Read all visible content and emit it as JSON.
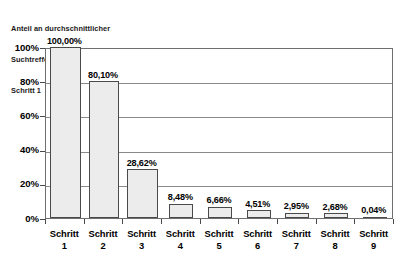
{
  "chart_data": {
    "type": "bar",
    "title": "Anteil an durchschnittlicher Suchtrefferanzahl von Schritt 1",
    "title_lines": [
      "Anteil an durchschnittlicher",
      "Suchtrefferanzahl von",
      "Schritt 1"
    ],
    "xlabel": "",
    "ylabel": "",
    "ylim": [
      0,
      100
    ],
    "grid": true,
    "legend": false,
    "categories": [
      "Schritt 1",
      "Schritt 2",
      "Schritt 3",
      "Schritt 4",
      "Schritt 5",
      "Schritt 6",
      "Schritt 7",
      "Schritt 8",
      "Schritt 9"
    ],
    "category_lines": [
      {
        "word": "Schritt",
        "num": "1"
      },
      {
        "word": "Schritt",
        "num": "2"
      },
      {
        "word": "Schritt",
        "num": "3"
      },
      {
        "word": "Schritt",
        "num": "4"
      },
      {
        "word": "Schritt",
        "num": "5"
      },
      {
        "word": "Schritt",
        "num": "6"
      },
      {
        "word": "Schritt",
        "num": "7"
      },
      {
        "word": "Schritt",
        "num": "8"
      },
      {
        "word": "Schritt",
        "num": "9"
      }
    ],
    "values": [
      100.0,
      80.1,
      28.62,
      8.48,
      6.66,
      4.51,
      2.95,
      2.68,
      0.04
    ],
    "data_labels": [
      "100,00%",
      "80,10%",
      "28,62%",
      "8,48%",
      "6,66%",
      "4,51%",
      "2,95%",
      "2,68%",
      "0,04%"
    ],
    "ytick_values": [
      0,
      20,
      40,
      60,
      80,
      100
    ],
    "ytick_labels": [
      "0%",
      "20%",
      "40%",
      "60%",
      "80%",
      "100%"
    ],
    "colors": {
      "bar_fill": "#ececec",
      "bar_border": "#4a4a4a",
      "gridline": "#8a8a8a",
      "axis": "#6f6f6f",
      "text": "#000000",
      "background": "#ffffff"
    }
  }
}
